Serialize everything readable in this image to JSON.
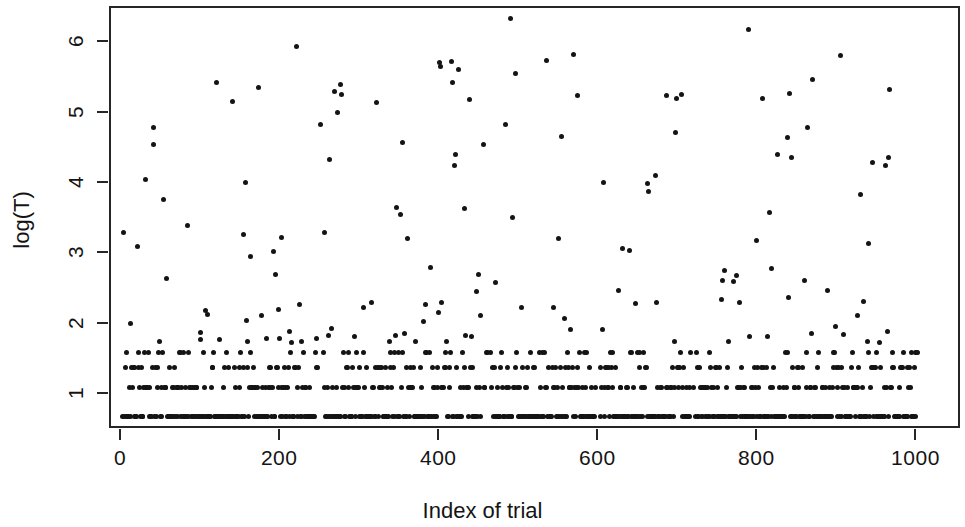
{
  "chart_data": {
    "type": "scatter",
    "title": "",
    "xlabel": "Index of trial",
    "ylabel": "log(T)",
    "xlim": [
      -14,
      1056
    ],
    "ylim": [
      0.5,
      6.5
    ],
    "xticks": [
      0,
      200,
      400,
      600,
      800,
      1000
    ],
    "xticklabels": [
      "0",
      "200",
      "400",
      "600",
      "800",
      "1000"
    ],
    "yticks": [
      1,
      2,
      3,
      4,
      5,
      6
    ],
    "yticklabels": [
      "1",
      "2",
      "3",
      "4",
      "5",
      "6"
    ],
    "grid": false,
    "legend": null,
    "marker": "filled-circle",
    "marker_color": "#141414",
    "marker_size_px": 5,
    "frame": "box",
    "n_points": 1000,
    "bands": [
      {
        "value": 0.693,
        "density": "very-high"
      },
      {
        "value": 1.099,
        "density": "high"
      },
      {
        "value": 1.386,
        "density": "medium"
      },
      {
        "value": 1.609,
        "density": "medium-low"
      }
    ],
    "series": [
      {
        "name": "log(T)",
        "x": [
          6,
          10,
          12,
          14,
          16,
          19,
          21,
          24,
          26,
          29,
          31,
          33,
          35,
          38,
          40,
          43,
          45,
          47,
          50,
          52,
          55,
          57,
          59,
          62,
          64,
          67,
          69,
          71,
          74,
          76,
          79,
          81,
          83,
          86,
          88,
          91,
          93,
          95,
          98,
          100,
          103,
          105,
          107,
          110,
          112,
          115,
          117,
          119,
          122,
          124,
          127,
          129,
          131,
          134,
          136,
          139,
          141,
          143,
          146,
          148,
          151,
          153,
          155,
          158,
          160,
          163,
          165,
          167,
          170,
          172,
          175,
          177,
          179,
          182,
          184,
          187,
          189,
          191,
          194,
          196,
          199,
          201,
          203,
          206,
          208,
          211,
          213,
          215,
          218,
          220,
          223,
          225,
          227,
          230,
          232,
          235,
          237,
          239,
          242,
          244,
          247,
          249,
          251,
          254,
          256,
          259,
          261,
          263,
          266,
          268,
          271,
          273,
          275,
          278,
          280,
          283,
          285,
          287,
          290,
          292,
          295,
          297,
          299,
          302,
          304,
          307,
          309,
          311,
          314,
          316,
          319,
          321,
          323,
          326,
          328,
          331,
          333,
          335,
          338,
          340,
          343,
          345,
          347,
          350,
          352,
          355,
          357,
          359,
          362,
          364,
          367,
          369,
          371,
          374,
          376,
          379,
          381,
          383,
          386,
          388,
          391,
          393,
          395,
          398,
          400,
          403,
          405,
          407,
          410,
          412,
          415,
          417,
          419,
          422,
          424,
          427,
          429,
          431,
          434,
          436,
          439,
          441,
          443,
          446,
          448,
          451,
          453,
          455,
          458,
          460,
          463,
          465,
          467,
          470,
          472,
          475,
          477,
          479,
          482,
          484,
          487,
          489,
          491,
          494,
          496,
          499,
          501,
          503,
          506,
          508,
          511,
          513,
          515,
          518,
          520,
          523,
          525,
          527,
          530,
          532,
          535,
          537,
          539,
          542,
          544,
          547,
          549,
          551,
          554,
          556,
          559,
          561,
          563,
          566,
          568,
          571,
          573,
          575,
          578,
          580,
          583,
          585,
          587,
          590,
          592,
          595,
          597,
          599,
          602,
          604,
          607,
          609,
          611,
          614,
          616,
          619,
          621,
          623,
          626,
          628,
          631,
          633,
          635,
          638,
          640,
          643,
          645,
          647,
          650,
          652,
          655,
          657,
          659,
          662,
          664,
          667,
          669,
          671,
          674,
          676,
          679,
          681,
          683,
          686,
          688,
          691,
          693,
          695,
          698,
          700,
          703,
          705,
          707,
          710,
          712,
          715,
          717,
          719,
          722,
          724,
          727,
          729,
          731,
          734,
          736,
          739,
          741,
          743,
          746,
          748,
          751,
          753,
          755,
          758,
          760,
          763,
          765,
          767,
          770,
          772,
          775,
          777,
          779,
          782,
          784,
          787,
          789,
          791,
          794,
          796,
          799,
          801,
          803,
          806,
          808,
          811,
          813,
          815,
          818,
          820,
          823,
          825,
          827,
          830,
          832,
          835,
          837,
          839,
          842,
          844,
          847,
          849,
          851,
          854,
          856,
          859,
          861,
          863,
          866,
          868,
          871,
          873,
          875,
          878,
          880,
          883,
          885,
          887,
          890,
          892,
          895,
          897,
          899,
          902,
          904,
          907,
          909,
          911,
          914,
          916,
          919,
          921,
          923,
          926,
          928,
          931,
          933,
          935,
          938,
          940,
          943,
          945,
          947,
          950,
          952,
          955,
          957,
          959,
          962,
          964,
          967,
          969,
          971,
          974,
          976,
          979,
          981,
          983,
          986,
          988,
          991,
          993,
          995,
          998,
          1000
        ],
        "y_summary": "Approximately 45% of points at 0.693, 20% at 1.099, 13% at 1.386, 8% at 1.609, remaining 14% spread from 1.8 to 6.35"
      }
    ],
    "extreme_points": [
      {
        "x": 488,
        "y": 6.35
      },
      {
        "x": 787,
        "y": 6.2
      },
      {
        "x": 903,
        "y": 5.83
      },
      {
        "x": 172,
        "y": 5.37
      },
      {
        "x": 573,
        "y": 5.25
      },
      {
        "x": 697,
        "y": 5.21
      },
      {
        "x": 271,
        "y": 5.02
      },
      {
        "x": 249,
        "y": 4.85
      },
      {
        "x": 482,
        "y": 4.84
      },
      {
        "x": 862,
        "y": 4.8
      }
    ]
  },
  "axes": {
    "x": {
      "label": "Index of trial",
      "ticks": [
        {
          "value": 0,
          "label": "0"
        },
        {
          "value": 200,
          "label": "200"
        },
        {
          "value": 400,
          "label": "400"
        },
        {
          "value": 600,
          "label": "600"
        },
        {
          "value": 800,
          "label": "800"
        },
        {
          "value": 1000,
          "label": "1000"
        }
      ]
    },
    "y": {
      "label": "log(T)",
      "ticks": [
        {
          "value": 1,
          "label": "1"
        },
        {
          "value": 2,
          "label": "2"
        },
        {
          "value": 3,
          "label": "3"
        },
        {
          "value": 4,
          "label": "4"
        },
        {
          "value": 5,
          "label": "5"
        },
        {
          "value": 6,
          "label": "6"
        }
      ]
    }
  },
  "colors": {
    "background": "#ffffff",
    "axis": "#262626",
    "marker": "#141414",
    "text": "#141414"
  }
}
